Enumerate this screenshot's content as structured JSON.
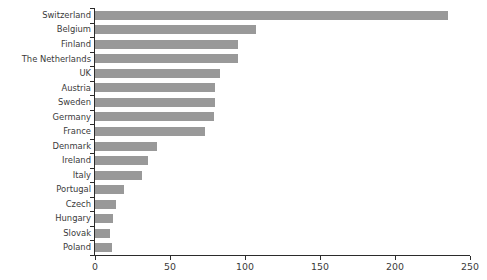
{
  "chart_data": {
    "type": "bar",
    "orientation": "horizontal",
    "title": "",
    "subtitle": "",
    "xlabel": "",
    "ylabel": "",
    "xlim": [
      0,
      250
    ],
    "xticks": [
      0,
      50,
      100,
      150,
      200,
      250
    ],
    "xtick_labels": [
      "0",
      "50",
      "100",
      "150",
      "200",
      "250"
    ],
    "grid": false,
    "legend": null,
    "bar_color": "#999999",
    "axis_color": "#2b2b2b",
    "label_color": "#3a3a3a",
    "categories": [
      "Switzerland",
      "Belgium",
      "Finland",
      "The Netherlands",
      "UK",
      "Austria",
      "Sweden",
      "Germany",
      "France",
      "Denmark",
      "Ireland",
      "Italy",
      "Portugal",
      "Czech",
      "Hungary",
      "Slovak",
      "Poland"
    ],
    "values": [
      235,
      107,
      95,
      95,
      83,
      80,
      80,
      79,
      73,
      41,
      35,
      31,
      19,
      14,
      12,
      10,
      11
    ]
  }
}
